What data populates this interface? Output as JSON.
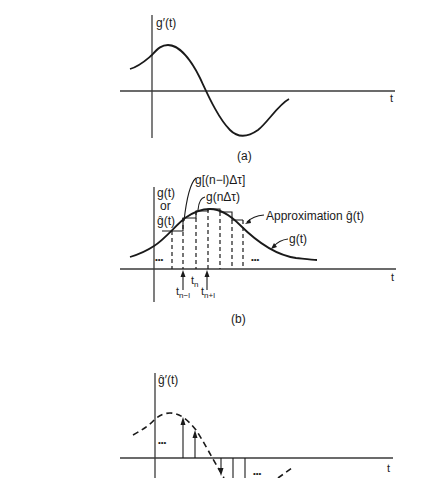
{
  "panels": {
    "a": {
      "caption": "(a)",
      "y_label": "g′(t)",
      "x_label": "t"
    },
    "b": {
      "caption": "(b)",
      "y_label_line1": "g(t)",
      "y_label_line2": "or",
      "y_label_line3": "ĝ(t)",
      "x_label": "t",
      "annotations": {
        "prev_sample": "g[(n−l)Δτ]",
        "current_sample": "g(nΔτ)",
        "approximation": "Approximation ĝ(t)",
        "true_signal": "g(t)"
      },
      "ellipsis_left": "•••",
      "ellipsis_right": "•••",
      "tick_labels": {
        "t_n_minus_1": {
          "base": "t",
          "sub": "n−l"
        },
        "t_n": {
          "base": "t",
          "sub": "n"
        },
        "t_n_plus_1": {
          "base": "t",
          "sub": "n+l"
        }
      },
      "sample_boundaries_x": [
        172,
        183,
        196,
        208,
        220,
        232,
        243
      ],
      "step_heights_y": [
        231,
        218,
        211,
        209,
        212,
        220
      ]
    },
    "c": {
      "y_label": "ĝ′(t)",
      "x_label": "t",
      "ellipsis_left": "•••",
      "ellipsis_right": "•••"
    }
  }
}
